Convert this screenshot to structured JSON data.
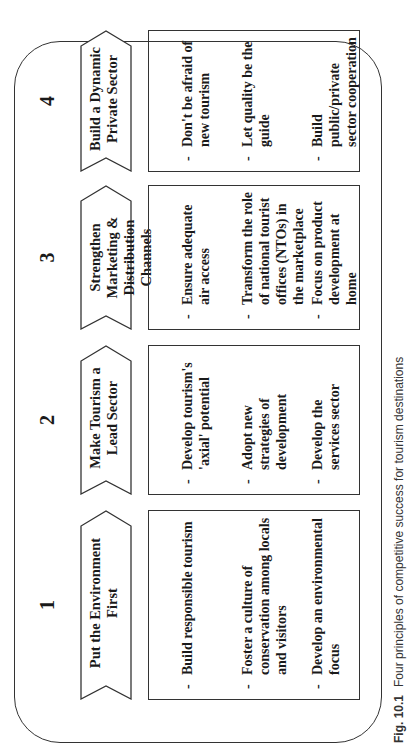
{
  "figure": {
    "caption_label": "Fig. 10.1",
    "caption_text": "Four principles of competitive success for tourism destinations"
  },
  "principles": [
    {
      "number": "1",
      "title": "Put the Environment First",
      "items": [
        "Build responsible tourism",
        "Foster a culture of conservation among locals and visitors",
        "Develop an environmental focus"
      ]
    },
    {
      "number": "2",
      "title": "Make Tourism a Lead Sector",
      "items": [
        "Develop tourism's 'axial' potential",
        "Adopt new strategies of development",
        "Develop the services sector"
      ]
    },
    {
      "number": "3",
      "title": "Strengthen Marketing & Distribution Channels",
      "items": [
        "Ensure adequate air access",
        "Transform the role of national tourist offices (NTOs) in the marketplace",
        "Focus on product development at home"
      ]
    },
    {
      "number": "4",
      "title": "Build a Dynamic Private Sector",
      "items": [
        "Don't be afraid of new tourism",
        "Let quality be the guide",
        "Build public/private sector cooperation"
      ]
    }
  ],
  "bullet_glyph": "-"
}
